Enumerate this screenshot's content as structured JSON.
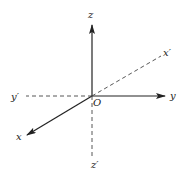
{
  "diagram": {
    "colors": {
      "line": "#222222",
      "background": "#ffffff"
    },
    "labels": {
      "z": "z",
      "z_neg": "z′",
      "y": "y",
      "y_neg": "y′",
      "x": "x",
      "x_neg": "x′",
      "origin": "O"
    }
  }
}
